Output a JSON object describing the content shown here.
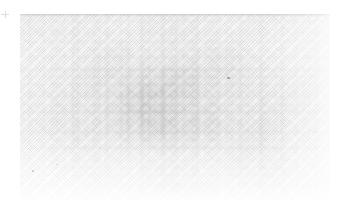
{
  "image": {
    "kind": "scanned-photograph",
    "condition": "faded",
    "legible_text": "",
    "width": 340,
    "height": 215,
    "background_color": "#ffffff"
  },
  "plate": {
    "label": "scanned-plate",
    "left": 20,
    "top": 14,
    "width": 310,
    "height": 186,
    "base_color": "#f3f3f3",
    "edge_color": "#9a9a9a",
    "texture": "diagonal-scanlines",
    "note": ""
  },
  "crop_mark": {
    "label": "registration-mark",
    "left": 1,
    "top": 11,
    "color": "#8d8d8d"
  },
  "specks": [
    {
      "name": "speck-right",
      "left": 207,
      "top": 63,
      "width": 3,
      "height": 2,
      "opacity": 0.62
    },
    {
      "name": "speck-lower-left",
      "left": 12,
      "top": 156,
      "width": 2,
      "height": 2,
      "opacity": 0.34
    },
    {
      "name": "speck-lower-left2",
      "left": 36,
      "top": 150,
      "width": 2,
      "height": 1,
      "opacity": 0.28
    },
    {
      "name": "speck-upper-left",
      "left": 53,
      "top": 38,
      "width": 1,
      "height": 1,
      "opacity": 0.22
    },
    {
      "name": "speck-center",
      "left": 130,
      "top": 94,
      "width": 1,
      "height": 1,
      "opacity": 0.2
    }
  ]
}
